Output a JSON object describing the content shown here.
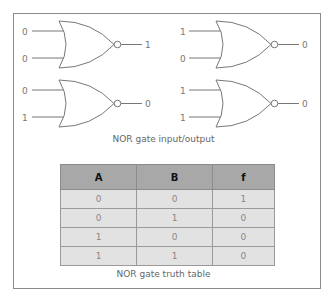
{
  "gates": [
    {
      "inputs": [
        "0",
        "0"
      ],
      "output": "1"
    },
    {
      "inputs": [
        "1",
        "0"
      ],
      "output": "0"
    },
    {
      "inputs": [
        "0",
        "1"
      ],
      "output": "0"
    },
    {
      "inputs": [
        "1",
        "1"
      ],
      "output": "0"
    }
  ],
  "captions": {
    "diagram": "NOR gate input/output",
    "table": "NOR gate truth table"
  },
  "truth_table": {
    "headers": [
      "A",
      "B",
      "f"
    ],
    "rows": [
      [
        "0",
        "0",
        "1"
      ],
      [
        "0",
        "1",
        "0"
      ],
      [
        "1",
        "0",
        "0"
      ],
      [
        "1",
        "1",
        "0"
      ]
    ]
  },
  "colors": {
    "header_bg": "#a8a8a8",
    "row_bg": "#e2e2e2",
    "line": "#777777"
  }
}
